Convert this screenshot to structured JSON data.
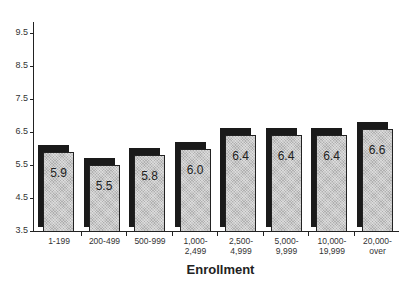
{
  "chart_data": {
    "type": "bar",
    "title": "",
    "xlabel": "Enrollment",
    "ylabel": "",
    "ylim": [
      3.5,
      9.5
    ],
    "yticks": [
      "3.5",
      "4.5",
      "5.5",
      "6.5",
      "7.5",
      "8.5",
      "9.5"
    ],
    "categories": [
      "1-199",
      "200-499",
      "500-999",
      "1,000-\n2,499",
      "2,500-\n4,999",
      "5,000-\n9,999",
      "10,000-\n19,999",
      "20,000-\nover"
    ],
    "values": [
      5.9,
      5.5,
      5.8,
      6.0,
      6.4,
      6.4,
      6.4,
      6.6
    ],
    "value_labels": [
      "5.9",
      "5.5",
      "5.8",
      "6.0",
      "6.4",
      "6.4",
      "6.4",
      "6.6"
    ],
    "grid": false,
    "legend": null,
    "style": "3d-shadow bars with stippled gray fill and black offset shadow"
  },
  "colors": {
    "bar_fill": "#c8c8c8",
    "bar_shadow": "#1a1a1a",
    "axis": "#222222"
  }
}
